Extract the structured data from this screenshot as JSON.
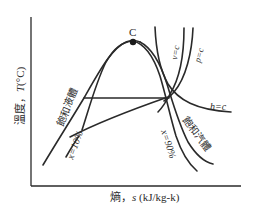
{
  "diagram": {
    "type": "T-s diagram",
    "x_axis_label": "熵，s (kJ/kg-k)",
    "x_axis_label_parts": {
      "prefix": "熵，",
      "var": "s",
      "unit": " (kJ/kg-k)"
    },
    "y_axis_label": "溫度，T(°C)",
    "y_axis_label_parts": {
      "prefix": "溫度，",
      "var": "T",
      "unit": "(°C)"
    },
    "critical_point_label": "C",
    "curve_labels": {
      "saturated_liquid": "飽和液體",
      "saturated_vapor": "飽和汽體",
      "quality_10": "x=10%",
      "quality_90": "x=90%",
      "constant_volume": "v=c",
      "constant_pressure": "p=c",
      "constant_enthalpy": "h=c"
    },
    "colors": {
      "line": "#2a2a2a",
      "background": "#ffffff"
    }
  }
}
